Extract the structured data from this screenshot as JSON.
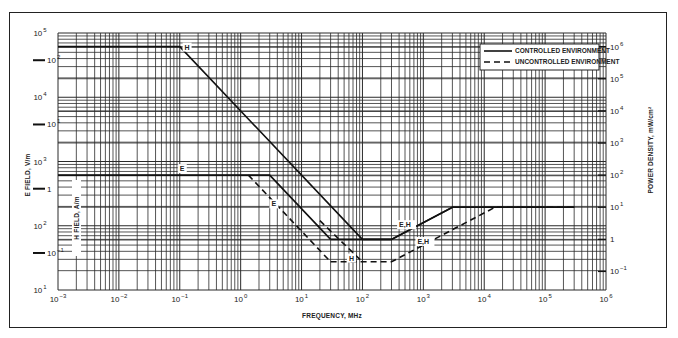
{
  "chart_data": {
    "type": "line",
    "title": "",
    "xlabel": "FREQUENCY, MHz",
    "ylabel": "E FIELD, V/m",
    "ylabel_inner": "H FIELD, A/m",
    "ylabel_right": "POWER DENSITY, mW/cm²",
    "xscale": "log",
    "yscale": "log",
    "xlim": [
      0.001,
      1000000
    ],
    "ylim": [
      10,
      100000
    ],
    "grid": true,
    "legend_position": "upper right",
    "x_ticks": [
      {
        "base": "10",
        "exp": "−3"
      },
      {
        "base": "10",
        "exp": "−2"
      },
      {
        "base": "10",
        "exp": "−1"
      },
      {
        "base": "10",
        "exp": "0"
      },
      {
        "base": "10",
        "exp": "1"
      },
      {
        "base": "10",
        "exp": "2"
      },
      {
        "base": "10",
        "exp": "3"
      },
      {
        "base": "10",
        "exp": "4"
      },
      {
        "base": "10",
        "exp": "5"
      },
      {
        "base": "10",
        "exp": "6"
      }
    ],
    "y_ticks_left": [
      {
        "base": "10",
        "exp": "5"
      },
      {
        "base": "10",
        "exp": "4"
      },
      {
        "base": "10",
        "exp": "3"
      },
      {
        "base": "10",
        "exp": "2"
      },
      {
        "base": "10",
        "exp": "1"
      }
    ],
    "y_ticks_inner_h": [
      {
        "base": "10",
        "exp": "2"
      },
      {
        "base": "10",
        "exp": "1"
      },
      {
        "base": "1",
        "exp": ""
      },
      {
        "base": "10",
        "exp": "−1"
      }
    ],
    "y_ticks_right": [
      {
        "base": "10",
        "exp": "6"
      },
      {
        "base": "10",
        "exp": "5"
      },
      {
        "base": "10",
        "exp": "4"
      },
      {
        "base": "10",
        "exp": "3"
      },
      {
        "base": "10",
        "exp": "2"
      },
      {
        "base": "10",
        "exp": "1"
      },
      {
        "base": "1",
        "exp": ""
      },
      {
        "base": "10",
        "exp": "−1"
      }
    ],
    "legend": [
      {
        "label": "CONTROLLED ENVIRONMENT",
        "style": "solid"
      },
      {
        "label": "UNCONTROLLED ENVIRONMENT",
        "style": "dashed"
      }
    ],
    "series": [
      {
        "name": "Controlled H",
        "style": "solid",
        "label": "H",
        "x": [
          0.001,
          0.1,
          100,
          300,
          3000,
          300000
        ],
        "y": [
          61400,
          61400,
          61.4,
          61.4,
          194,
          194
        ]
      },
      {
        "name": "Controlled E",
        "style": "solid",
        "label": "E",
        "x": [
          0.001,
          3,
          30
        ],
        "y": [
          614,
          614,
          61.4
        ]
      },
      {
        "name": "Controlled E,H (rising)",
        "style": "solid",
        "label": "E,H",
        "x": [
          30,
          100,
          300,
          3000,
          300000
        ],
        "y": [
          61.4,
          61.4,
          61.4,
          194,
          194
        ]
      },
      {
        "name": "Uncontrolled E",
        "style": "dashed",
        "label": "E",
        "x": [
          1.34,
          30
        ],
        "y": [
          614,
          27.5
        ]
      },
      {
        "name": "Uncontrolled H",
        "style": "dashed",
        "label": "H",
        "x": [
          20,
          100
        ],
        "y": [
          120,
          27.5
        ]
      },
      {
        "name": "Uncontrolled E,H",
        "style": "dashed",
        "label": "E,H",
        "x": [
          30,
          300,
          15000,
          300000
        ],
        "y": [
          27.5,
          27.5,
          194,
          194
        ]
      }
    ],
    "curve_labels": [
      {
        "text": "H",
        "series": "Controlled H"
      },
      {
        "text": "E",
        "series": "Controlled E"
      },
      {
        "text": "E",
        "series": "Uncontrolled E"
      },
      {
        "text": "H",
        "series": "Uncontrolled H"
      },
      {
        "text": "E,H",
        "series": "Controlled E,H"
      },
      {
        "text": "E,H",
        "series": "Uncontrolled E,H"
      }
    ]
  }
}
